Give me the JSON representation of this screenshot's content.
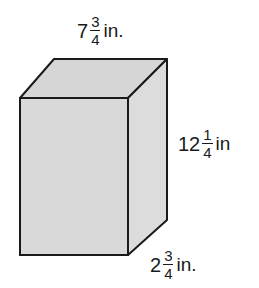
{
  "figure": {
    "type": "rectangular-prism",
    "colors": {
      "fill_front": "#d9d9d9",
      "fill_top": "#d6d6d6",
      "fill_side": "#dcdcdc",
      "stroke": "#1a1a1a"
    },
    "vertices": {
      "front_top_left": [
        20,
        98
      ],
      "front_top_right": [
        128,
        98
      ],
      "front_bottom_left": [
        20,
        255
      ],
      "front_bottom_right": [
        128,
        255
      ],
      "back_top_left": [
        54,
        59
      ],
      "back_top_right": [
        167,
        59
      ],
      "back_bottom_right": [
        167,
        220
      ]
    }
  },
  "labels": {
    "width": {
      "whole": "7",
      "numerator": "3",
      "denominator": "4",
      "unit": "in."
    },
    "height": {
      "whole": "12",
      "numerator": "1",
      "denominator": "4",
      "unit": "in"
    },
    "depth": {
      "whole": "2",
      "numerator": "3",
      "denominator": "4",
      "unit": "in."
    }
  }
}
